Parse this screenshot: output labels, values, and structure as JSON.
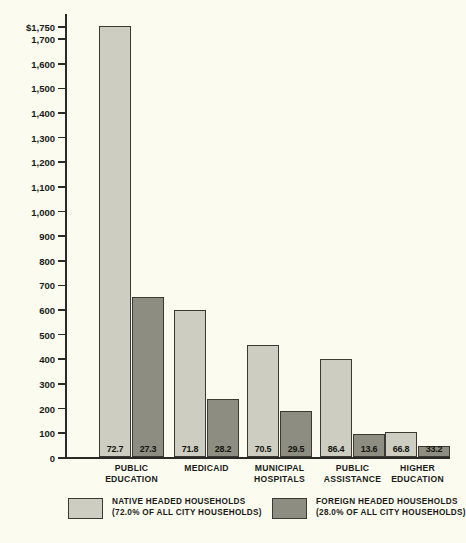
{
  "chart_data": {
    "type": "bar",
    "title": "",
    "xlabel": "",
    "ylabel": "NEW YORK CITY TAX LEVY DOLLARS (IN MILLIONS)",
    "ylim": [
      0,
      1750
    ],
    "grid": false,
    "legend_position": "bottom",
    "categories": [
      "PUBLIC EDUCATION",
      "MEDICAID",
      "MUNICIPAL HOSPITALS",
      "PUBLIC ASSISTANCE",
      "HIGHER EDUCATION"
    ],
    "category_lines": [
      [
        "PUBLIC",
        "EDUCATION"
      ],
      [
        "MEDICAID",
        ""
      ],
      [
        "MUNICIPAL",
        "HOSPITALS"
      ],
      [
        "PUBLIC",
        "ASSISTANCE"
      ],
      [
        "HIGHER",
        "EDUCATION"
      ]
    ],
    "series": [
      {
        "name": "NATIVE HEADED HOUSEHOLDS",
        "color": "#cdcdc2",
        "values": [
          1750,
          595,
          455,
          400,
          100
        ],
        "data_labels": [
          "72.7",
          "71.8",
          "70.5",
          "86.4",
          "66.8"
        ]
      },
      {
        "name": "FOREIGN HEADED HOUSEHOLDS",
        "color": "#8d8d82",
        "values": [
          650,
          235,
          185,
          95,
          45
        ],
        "data_labels": [
          "27.3",
          "28.2",
          "29.5",
          "13.6",
          "33.2"
        ]
      }
    ],
    "ytick_labels": [
      "$1,750",
      "1,700",
      "1,600",
      "1,500",
      "1,400",
      "1,300",
      "1,200",
      "1,100",
      "1,000",
      "900",
      "800",
      "700",
      "600",
      "500",
      "400",
      "300",
      "200",
      "100",
      "0"
    ],
    "ytick_values": [
      1750,
      1700,
      1600,
      1500,
      1400,
      1300,
      1200,
      1100,
      1000,
      900,
      800,
      700,
      600,
      500,
      400,
      300,
      200,
      100,
      0
    ]
  },
  "legend": {
    "entries": [
      {
        "line1": "NATIVE HEADED HOUSEHOLDS",
        "line2": "(72.0% OF ALL CITY HOUSEHOLDS)"
      },
      {
        "line1": "FOREIGN HEADED HOUSEHOLDS",
        "line2": "(28.0% OF ALL CITY HOUSEHOLDS)"
      }
    ]
  }
}
